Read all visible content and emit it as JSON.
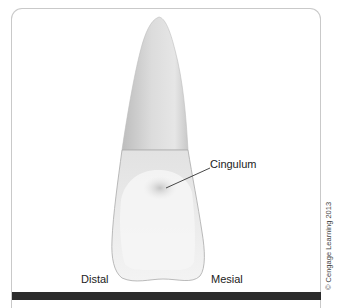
{
  "figure": {
    "labels": {
      "cingulum": "Cingulum",
      "distal": "Distal",
      "mesial": "Mesial"
    },
    "copyright": "© Cengage Learning 2013"
  },
  "colors": {
    "frame_border": "#c9c9c9",
    "bottom_bar": "#2b2b2b",
    "tooth_root": "#d6d6d6",
    "tooth_crown": "#ececec",
    "leader_line": "#333333"
  }
}
